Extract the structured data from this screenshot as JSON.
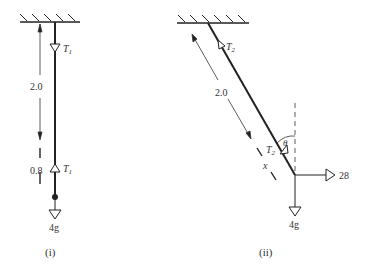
{
  "figure_i": {
    "caption": "(i)",
    "length_label": "2.0",
    "segment_label": "0.8",
    "tension_upper": "T",
    "tension_upper_sub": "1",
    "tension_lower": "T",
    "tension_lower_sub": "1",
    "weight_label": "4g"
  },
  "figure_ii": {
    "caption": "(ii)",
    "length_label": "2.0",
    "tension_upper": "T",
    "tension_upper_sub": "2",
    "tension_lower": "T",
    "tension_lower_sub": "2",
    "angle_label": "θ",
    "distance_label": "x",
    "horizontal_force_label": "28",
    "weight_label": "4g"
  },
  "colors": {
    "ink": "#222222",
    "background": "#ffffff"
  }
}
